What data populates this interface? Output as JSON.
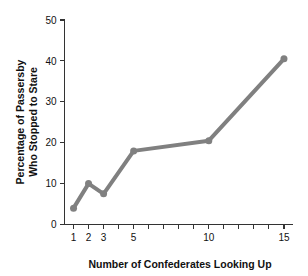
{
  "chart_data": {
    "type": "line",
    "title": "",
    "xlabel": "Number of Confederates Looking Up",
    "ylabel": "Percentage of Passersby Who Stopped to Stare",
    "ylabel_line1": "Percentage of Passersby",
    "ylabel_line2": "Who Stopped to Stare",
    "x": [
      1,
      2,
      3,
      5,
      10,
      15
    ],
    "values": [
      4,
      10,
      7.5,
      18,
      20.5,
      40.5
    ],
    "xlim": [
      0.4,
      15.6
    ],
    "ylim": [
      0,
      50
    ],
    "xticks": [
      1,
      2,
      3,
      4,
      5,
      6,
      7,
      8,
      9,
      10,
      11,
      12,
      13,
      14,
      15
    ],
    "xtick_labels_shown": [
      "1",
      "2",
      "3",
      "5",
      "10",
      "15"
    ],
    "xtick_label_values": [
      1,
      2,
      3,
      5,
      10,
      15
    ],
    "yticks": [
      0,
      10,
      20,
      30,
      40,
      50
    ],
    "ytick_labels": [
      "0",
      "10",
      "20",
      "30",
      "40",
      "50"
    ],
    "grid": false,
    "legend": false,
    "series_color": "#808080",
    "marker": "circle",
    "marker_size": 7,
    "line_width": 4,
    "axis_color": "#333333"
  }
}
